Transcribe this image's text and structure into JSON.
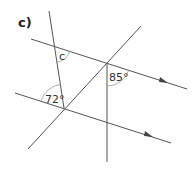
{
  "part_label": "c)",
  "angles": {
    "unknown": "c",
    "top_right": "85°",
    "bottom_left": "72°"
  },
  "colors": {
    "line": "#555555",
    "arc": "#999999",
    "text": "#222222"
  }
}
